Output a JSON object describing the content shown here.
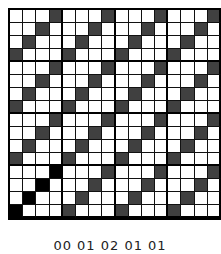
{
  "figure": {
    "rows": 16,
    "cols": 16,
    "block_size": 4,
    "colors": {
      "background": "#ffffff",
      "grid_line": "#111111",
      "gray_cell": "#404040",
      "black_cell": "#000000"
    },
    "pattern_description": "Anti-diagonal stripes: in each 4-row band, row r has a filled cell at column (3 - r mod 4) within every 4-column block. Bottom band's first block cells are black; all others gray.",
    "black_cells": [
      [
        12,
        3
      ],
      [
        13,
        2
      ],
      [
        14,
        1
      ],
      [
        15,
        0
      ]
    ],
    "caption": "00  01 02  01  01"
  }
}
